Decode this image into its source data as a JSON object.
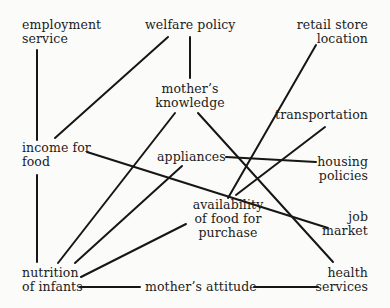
{
  "diagram": {
    "type": "causal-factor-network",
    "nodes": {
      "employment_service": {
        "lines": [
          "employment",
          "service"
        ]
      },
      "welfare_policy": {
        "lines": [
          "welfare policy"
        ]
      },
      "retail_store_location": {
        "lines": [
          "retail store",
          "location"
        ]
      },
      "mothers_knowledge": {
        "lines": [
          "mother’s",
          "knowledge"
        ]
      },
      "transportation": {
        "lines": [
          "transportation"
        ]
      },
      "income_for_food": {
        "lines": [
          "income for",
          "food"
        ]
      },
      "appliances": {
        "lines": [
          "appliances"
        ]
      },
      "housing_policies": {
        "lines": [
          "housing",
          "policies"
        ]
      },
      "availability_of_food": {
        "lines": [
          "availability",
          "of food for",
          "purchase"
        ]
      },
      "job_market": {
        "lines": [
          "job",
          "market"
        ]
      },
      "nutrition_of_infants": {
        "lines": [
          "nutrition",
          "of infants"
        ]
      },
      "mothers_attitude": {
        "lines": [
          "mother’s attitude"
        ]
      },
      "health_services": {
        "lines": [
          "health",
          "services"
        ]
      }
    },
    "edges": [
      {
        "from": "employment service",
        "to": "income for food",
        "coords": [
          37,
          50,
          37,
          140
        ]
      },
      {
        "from": "welfare policy",
        "to": "income for food",
        "coords": [
          168,
          37,
          55,
          138
        ]
      },
      {
        "from": "welfare policy",
        "to": "mother’s knowledge",
        "coords": [
          190,
          37,
          190,
          78
        ]
      },
      {
        "from": "retail store location",
        "to": "availability of food for purchase",
        "coords": [
          316,
          45,
          228,
          198
        ]
      },
      {
        "from": "mother’s knowledge",
        "to": "nutrition of infants",
        "coords": [
          175,
          113,
          58,
          263
        ]
      },
      {
        "from": "mother’s knowledge",
        "to": "health services",
        "coords": [
          198,
          113,
          333,
          262
        ]
      },
      {
        "from": "income for food",
        "to": "job market",
        "coords": [
          87,
          152,
          328,
          228
        ]
      },
      {
        "from": "income for food",
        "to": "nutrition of infants",
        "coords": [
          37,
          175,
          37,
          262
        ]
      },
      {
        "from": "transportation",
        "to": "availability of food for purchase",
        "coords": [
          325,
          127,
          236,
          195
        ]
      },
      {
        "from": "appliances",
        "to": "housing policies",
        "coords": [
          226,
          157,
          316,
          162
        ]
      },
      {
        "from": "appliances",
        "to": "nutrition of infants",
        "coords": [
          182,
          166,
          75,
          263
        ]
      },
      {
        "from": "availability of food for purchase",
        "to": "nutrition of infants",
        "coords": [
          186,
          224,
          81,
          277
        ]
      },
      {
        "from": "nutrition of infants",
        "to": "mother’s attitude",
        "coords": [
          80,
          287,
          140,
          287
        ]
      },
      {
        "from": "mother’s attitude",
        "to": "health services",
        "coords": [
          254,
          287,
          318,
          287
        ]
      }
    ],
    "colors": {
      "background": "#fbfbf9",
      "ink": "#161616"
    }
  }
}
